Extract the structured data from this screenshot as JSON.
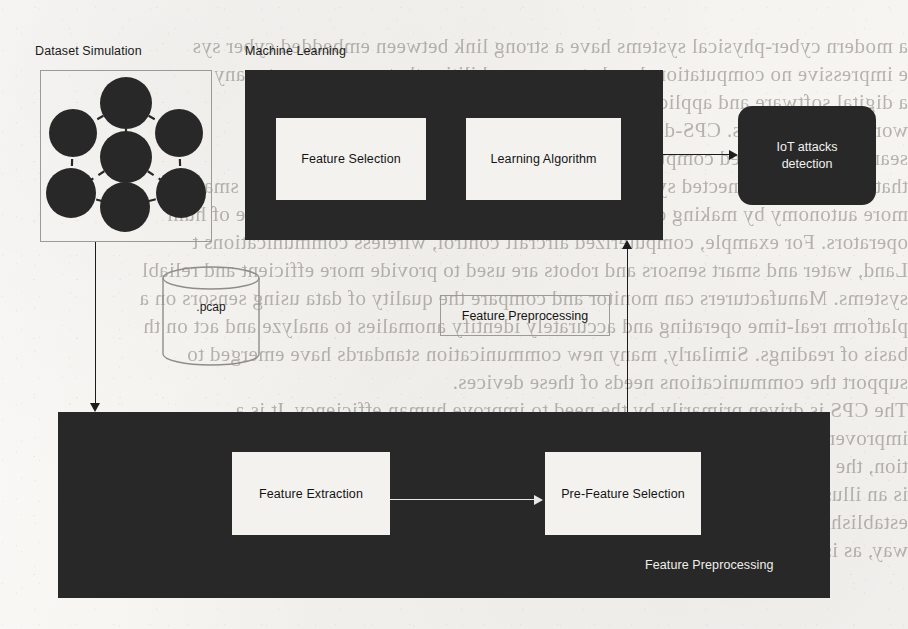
{
  "diagram": {
    "colors": {
      "block_fill": "#282828",
      "inner_fill": "#f3f2ef",
      "text_dark": "#141414",
      "text_light": "#f0efec",
      "outline": "#9a9a96",
      "paper": "#f7f6f3"
    },
    "labels": {
      "dataset_simulation": "Dataset Simulation",
      "machine_learning": "Machine Learning",
      "feature_selection": "Feature Selection",
      "learning_algorithm": "Learning Algorithm",
      "iot_attacks_detection_line1": "IoT attacks",
      "iot_attacks_detection_line2": "detection",
      "pcap": ".pcap",
      "feature_preprocessing_outline": "Feature Preprocessing",
      "feature_extraction": "Feature Extraction",
      "pre_feature_selection": "Pre-Feature Selection",
      "feature_preprocessing_inner": "Feature Preprocessing"
    },
    "graph": {
      "node_count": 7,
      "edge_style": "dashed",
      "node_fill": "#282828"
    },
    "icons": {
      "network_graph": "network-graph-icon",
      "database_cylinder": "database-cylinder-icon"
    }
  },
  "background_bleed": {
    "lines": [
      "a modern cyber-physical systems have a strong link between embedded cyber sys",
      "e impressive no computational and storage capabilities that can carry out many",
      "a digital software and applications. The system can interact and explo",
      "world environments. CPS-defined as a engineered systems that are bui",
      "seamlessly integrated computational and physical components. The CPS s",
      "that are an interconnected systems of Al Engineering systems are becoming smar",
      "more autonomy by making decisions on their own without the direct involve of hum",
      "operators. For example, computerized aircraft control, wireless communications t",
      "Land, water and smart sensors and robots are used to provide more efficient and reliabl",
      "systems. Manufacturers can monitor and compare the quality of data using sensors on a",
      "platform real-time operating and accurately identify anomalies to analyze and act on th",
      "basis of readings. Similarly, many new communication standards have emerged to",
      "support the communications needs of these devices.",
      "The CPS is driven primarily by the need to improve human efficiency. It is a",
      "improvement, the growing number of advanced technologies, and their interconnec",
      "tion, the Internet of computer connected things that are computationally driven",
      "is an illustration of a cyber-physical system. The IoT is the process of",
      "establishing a common framework for CPS applications is a practical and efficient",
      "way, as is possibly illustrated in Figure 8.2."
    ]
  }
}
